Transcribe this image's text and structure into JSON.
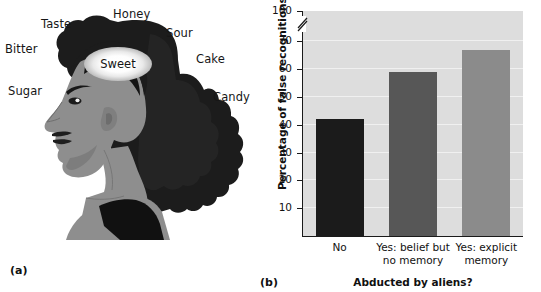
{
  "figure": {
    "panel_a_letter": "(a)",
    "panel_b_letter": "(b)"
  },
  "illustration": {
    "name": "woman-head-profile-with-word-list",
    "center_word": "Sweet",
    "associated_words": [
      {
        "label": "Taste",
        "x": 41,
        "y": 17
      },
      {
        "label": "Honey",
        "x": 113,
        "y": 7
      },
      {
        "label": "Sour",
        "x": 166,
        "y": 26
      },
      {
        "label": "Bitter",
        "x": 5,
        "y": 42
      },
      {
        "label": "Cake",
        "x": 196,
        "y": 52
      },
      {
        "label": "Sugar",
        "x": 8,
        "y": 84
      },
      {
        "label": "Candy",
        "x": 213,
        "y": 90
      }
    ],
    "colors": {
      "hair_dark": "#1c1c1c",
      "hair_shadow": "#2c2c2c",
      "skin": "#8e8e8e",
      "skin_shade": "#7d7d7d",
      "top_black": "#111111",
      "glow": "#ffffff"
    }
  },
  "chart_data": {
    "type": "bar",
    "title": "",
    "xlabel": "Abducted by aliens?",
    "ylabel": "Percentage of false recognitions",
    "categories": [
      "No",
      "Yes: belief but\nno memory",
      "Yes: explicit\nmemory"
    ],
    "category_lines": [
      [
        "No"
      ],
      [
        "Yes: belief but",
        "no memory"
      ],
      [
        "Yes: explicit",
        "memory"
      ]
    ],
    "values": [
      42,
      59,
      67
    ],
    "ylim": [
      0,
      100
    ],
    "ytick_labels": [
      "10",
      "20",
      "30",
      "40",
      "50",
      "60",
      "70",
      "100"
    ],
    "ytick_values": [
      10,
      20,
      30,
      40,
      50,
      60,
      70,
      100
    ],
    "axis_break_between": [
      70,
      100
    ],
    "grid": true,
    "legend": "none",
    "bar_colors": [
      "#1b1b1b",
      "#575757",
      "#8b8b8b"
    ],
    "plot_background": "#dddddd"
  }
}
